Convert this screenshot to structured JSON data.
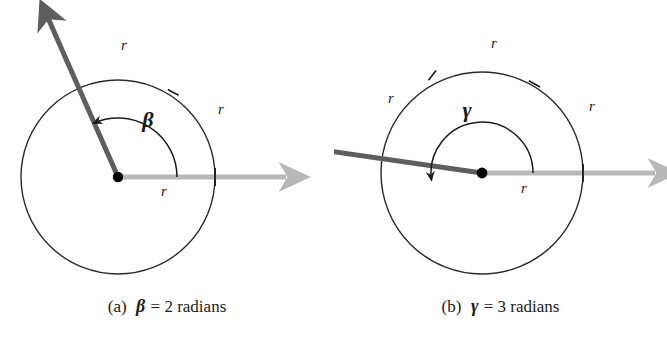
{
  "figure": {
    "title_visible": false,
    "background_color": "#ffffff"
  },
  "colors": {
    "circle_stroke": "#2b2b2b",
    "arc_stroke": "#1a1a1a",
    "terminal_ray": "#5e5e5e",
    "initial_ray": "#b8b8b8",
    "text": "#1a1a1a",
    "center_dot": "#000000"
  },
  "panels": [
    {
      "id": "a",
      "caption": {
        "tag": "(a)",
        "symbol": "β",
        "rest": "= 2 radians"
      },
      "angle": {
        "symbol": "β",
        "value": 2,
        "unit": "radians"
      },
      "geometry": {
        "center_x": 118,
        "center_y": 177,
        "radius": 97,
        "arc_radius": 59,
        "arc_sweep_radians": 2,
        "arc_tick_count": 1
      },
      "radius_labels": [
        {
          "text": "r",
          "x": 124,
          "y": 50,
          "where": "arc-top"
        },
        {
          "text": "r",
          "x": 221,
          "y": 114,
          "where": "arc-right"
        },
        {
          "text": "r",
          "x": 164,
          "y": 196,
          "where": "initial-ray"
        }
      ],
      "angle_label": {
        "text": "β",
        "x": 148,
        "y": 127
      }
    },
    {
      "id": "b",
      "caption": {
        "tag": "(b)",
        "symbol": "γ",
        "rest": "= 3 radians"
      },
      "angle": {
        "symbol": "γ",
        "value": 3,
        "unit": "radians"
      },
      "geometry": {
        "center_x": 482,
        "center_y": 173,
        "radius": 101,
        "arc_radius": 51,
        "arc_sweep_radians": 3,
        "arc_tick_count": 2
      },
      "radius_labels": [
        {
          "text": "r",
          "x": 494,
          "y": 48,
          "where": "arc-top"
        },
        {
          "text": "r",
          "x": 391,
          "y": 103,
          "where": "arc-left"
        },
        {
          "text": "r",
          "x": 592,
          "y": 111,
          "where": "arc-right"
        },
        {
          "text": "r",
          "x": 524,
          "y": 193,
          "where": "initial-ray"
        }
      ],
      "angle_label": {
        "text": "γ",
        "x": 467,
        "y": 117
      }
    }
  ]
}
